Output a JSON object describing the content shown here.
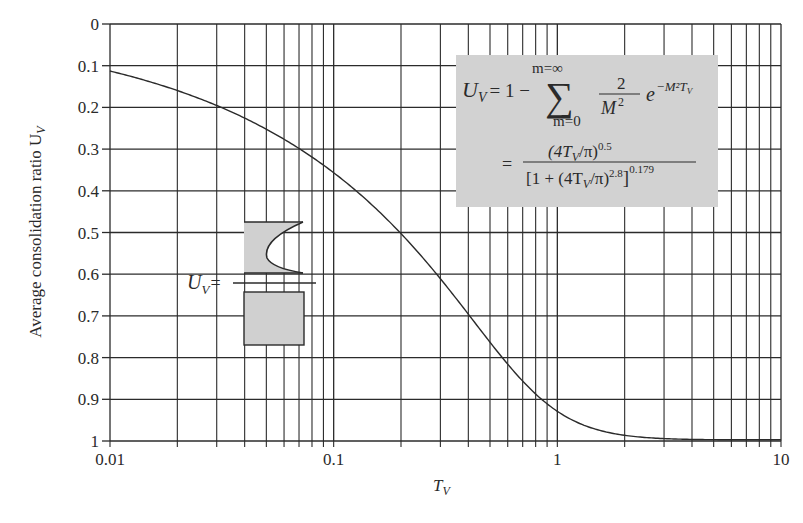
{
  "chart_data": {
    "type": "line",
    "title": "",
    "xlabel": "T_V",
    "xlabel_main": "T",
    "xlabel_sub": "V",
    "ylabel": "Average consolidation ratio U_V",
    "ylabel_main": "Average consolidation ratio U",
    "ylabel_sub": "V",
    "x_scale": "log",
    "xlim": [
      0.01,
      10
    ],
    "ylim": [
      0,
      1
    ],
    "y_inverted": true,
    "grid": true,
    "x_tick_labels": [
      "0.01",
      "0.1",
      "1",
      "10"
    ],
    "x_tick_values": [
      0.01,
      0.1,
      1,
      10
    ],
    "y_tick_labels": [
      "0",
      "0.1",
      "0.2",
      "0.3",
      "0.4",
      "0.5",
      "0.6",
      "0.7",
      "0.8",
      "0.9",
      "1"
    ],
    "y_tick_values": [
      0,
      0.1,
      0.2,
      0.3,
      0.4,
      0.5,
      0.6,
      0.7,
      0.8,
      0.9,
      1.0
    ],
    "series": [
      {
        "name": "U_V vs T_V",
        "x": [
          0.01,
          0.02,
          0.03,
          0.05,
          0.07,
          0.1,
          0.15,
          0.2,
          0.3,
          0.4,
          0.5,
          0.6,
          0.8,
          1.0,
          1.5,
          2.0,
          3.0,
          5.0,
          10.0
        ],
        "y": [
          0.113,
          0.16,
          0.195,
          0.252,
          0.299,
          0.357,
          0.437,
          0.504,
          0.613,
          0.698,
          0.764,
          0.816,
          0.887,
          0.931,
          0.98,
          0.994,
          0.999,
          1.0,
          1.0
        ]
      }
    ],
    "annotations": {
      "formula_box": {
        "lhs_main": "U",
        "lhs_sub": "V",
        "eq1_text": "= 1  −",
        "sum_upper": "m=∞",
        "sum_lower": "m=0",
        "sum_symbol": "∑",
        "frac1_num": "2",
        "frac1_den_main": "M",
        "frac1_den_exp": "2",
        "exp_base": "e",
        "exp_power": "−M²T",
        "exp_power_sub": "V",
        "eq2_sign": "=",
        "frac2_num_a": "(4T",
        "frac2_num_sub": "V",
        "frac2_num_b": "/π)",
        "frac2_num_exp": "0.5",
        "frac2_den_a": "[1 + (4T",
        "frac2_den_sub": "V",
        "frac2_den_b": "/π)",
        "frac2_den_exp": "2.8",
        "frac2_den_c": "]",
        "frac2_den_outer_exp": "0.179",
        "fill": "#d2d2d2"
      },
      "inset": {
        "label_main": "U",
        "label_sub": "V",
        "label_eq": "=",
        "fill": "#d0d0d0"
      }
    }
  },
  "colors": {
    "grid": "#2b2b2b",
    "curve": "#2b2b2b",
    "background": "#ffffff",
    "box": "#d2d2d2"
  }
}
